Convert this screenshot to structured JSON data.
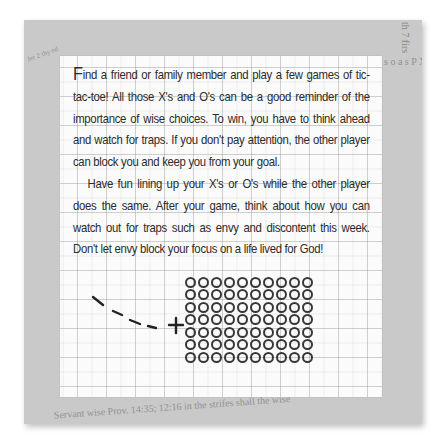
{
  "card": {
    "paragraphs": [
      {
        "dropcap": "F",
        "text": "ind a friend or family member and play a few games of tic-tac-toe! All those X's and O's can be a good reminder of the importance of wise choices. To win, you have to think ahead and watch for traps. If you don't pay attention, the other player can block you and keep you from your goal."
      },
      {
        "text": "Have fun lining up your X's or O's while the other player does the same. After your game, think about how you can watch out for traps such as envy and discontent this week. Don't let envy block your focus on a life lived for God!"
      }
    ],
    "illustration": {
      "description": "dashed-line-to-plus-and-o-grid",
      "o_rows": 7,
      "o_columns": 10,
      "plus_symbol": "+",
      "dash_count": 4
    }
  },
  "background": {
    "texture": "newspaper-clippings",
    "top_text": "th 7 firs ig by the t to f ed fr n hi u on big ha al up h up on to atch, th the Ju a wise more ath to h the that fo a para up into dedeth a",
    "right_text": "s o a s P X V G PROVE m 101 ay f a of a and b to th man ; t with, a adness three and fo r a ser a fool the wicked ench; is a lo the tr ga the wrong. A man s in the strifes t",
    "left_text": "Jer 2 thy ed & Ps. 12 12 hist. 4 Lam 35 PS, 1 b of his sander & a tech fire, s and a",
    "bottom_text": "Servant wise Prov. 14:35; 12:16 in the strifes shall the wise"
  },
  "colors": {
    "frame": "#c9c9c9",
    "card": "#fbfbfb",
    "text": "#2b2b2b",
    "grid": "#b4b4b4",
    "ink": "#222222"
  }
}
